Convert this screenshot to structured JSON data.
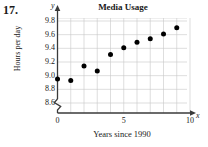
{
  "problem": {
    "number": "17."
  },
  "chart_data": {
    "type": "scatter",
    "title": "Media Usage",
    "xlabel": "Years since 1990",
    "ylabel": "Hours per day",
    "x_axis_letter": "x",
    "y_axis_letter": "y",
    "xlim": [
      0,
      10
    ],
    "ylim": [
      8.5,
      9.9
    ],
    "y_axis_break": true,
    "grid": true,
    "legend": "none",
    "xticks": [
      "0",
      "5",
      "10"
    ],
    "xtick_values": [
      0,
      5,
      10
    ],
    "yticks": [
      "8.6",
      "8.8",
      "9.0",
      "9.2",
      "9.4",
      "9.6",
      "9.8"
    ],
    "ytick_values": [
      8.6,
      8.8,
      9.0,
      9.2,
      9.4,
      9.6,
      9.8
    ],
    "x": [
      0,
      1,
      2,
      3,
      4,
      5,
      6,
      7,
      8,
      9
    ],
    "values": [
      8.95,
      8.93,
      9.14,
      9.07,
      9.31,
      9.41,
      9.49,
      9.54,
      9.61,
      9.7
    ],
    "marker": "filled-circle",
    "marker_color": "#000000",
    "grid_color": "#c8c8c8",
    "axis_color": "#3a3a3a"
  }
}
